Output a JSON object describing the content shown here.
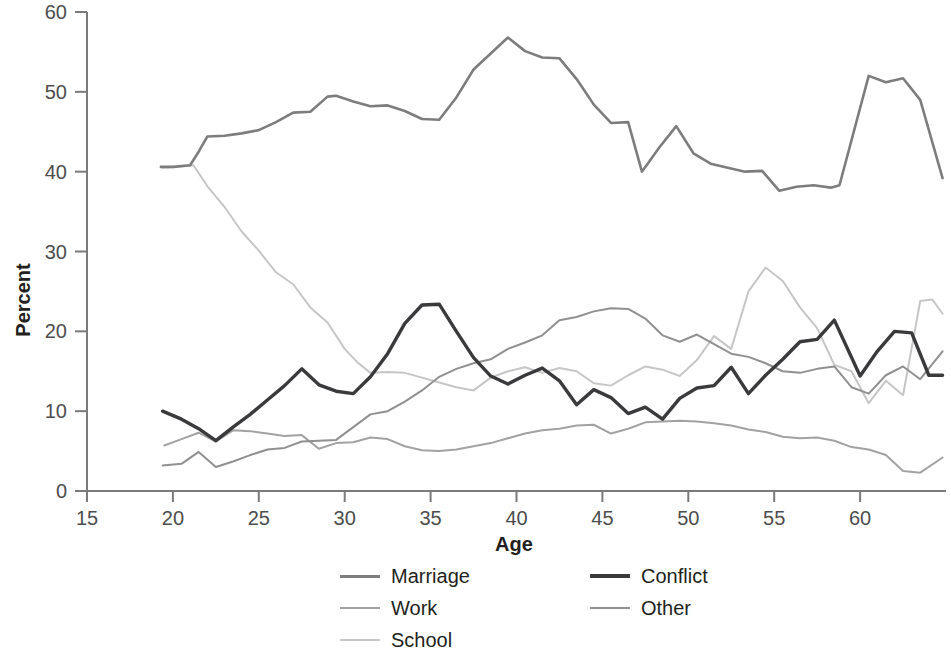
{
  "chart_data": {
    "type": "line",
    "title": "",
    "xlabel": "Age",
    "ylabel": "Percent",
    "xlim": [
      15,
      65
    ],
    "ylim": [
      0,
      60
    ],
    "xticks": [
      15,
      20,
      25,
      30,
      35,
      40,
      45,
      50,
      55,
      60
    ],
    "yticks": [
      0,
      10,
      20,
      30,
      40,
      50,
      60
    ],
    "grid": false,
    "legend_position": "bottom",
    "series": [
      {
        "name": "Marriage",
        "color": "#7d7d7d",
        "width": 2.6,
        "x": [
          19.3,
          20,
          21,
          21.5,
          22,
          23,
          24,
          25,
          26,
          27,
          28,
          29,
          29.5,
          30.5,
          31.5,
          32.5,
          33.5,
          34.5,
          35.5,
          36.5,
          37.5,
          38.5,
          39.5,
          40.5,
          41.5,
          42.5,
          43.5,
          44.5,
          45.5,
          46.5,
          47.3,
          48.3,
          49.3,
          50.3,
          51.3,
          52.3,
          53.3,
          54.3,
          55.3,
          56.3,
          57.3,
          58.3,
          58.8,
          60.5,
          61.5,
          62.5,
          63.5,
          64.8
        ],
        "values": [
          40.6,
          40.6,
          40.8,
          42.5,
          44.4,
          44.5,
          44.8,
          45.2,
          46.2,
          47.4,
          47.5,
          49.4,
          49.5,
          48.8,
          48.2,
          48.3,
          47.6,
          46.6,
          46.5,
          49.3,
          52.8,
          54.8,
          56.8,
          55.1,
          54.3,
          54.2,
          51.6,
          48.4,
          46.1,
          46.2,
          40.0,
          43.0,
          45.7,
          42.3,
          41.0,
          40.5,
          40.0,
          40.1,
          37.6,
          38.1,
          38.3,
          38.0,
          38.3,
          52.0,
          51.2,
          51.7,
          49.0,
          39.2
        ],
        "final_value": 39.2
      },
      {
        "name": "Conflict",
        "color": "#3a3a3c",
        "width": 3.4,
        "x": [
          19.4,
          20.5,
          21.5,
          22.5,
          23.5,
          24.5,
          25.5,
          26.5,
          27.5,
          28.5,
          29.5,
          30.5,
          31.5,
          32.5,
          33.5,
          34.5,
          35.5,
          36.5,
          37.5,
          38.5,
          39.5,
          40.5,
          41.5,
          42.5,
          43.5,
          44.5,
          45.5,
          46.5,
          47.5,
          48.5,
          49.5,
          50.5,
          51.5,
          52.5,
          53.5,
          54.5,
          55.5,
          56.5,
          57.5,
          58.5,
          60.0,
          61.0,
          62.0,
          63.0,
          64.0,
          64.8
        ],
        "values": [
          10.0,
          9.0,
          7.8,
          6.3,
          8.0,
          9.6,
          11.4,
          13.2,
          15.3,
          13.3,
          12.5,
          12.2,
          14.3,
          17.2,
          21.0,
          23.3,
          23.4,
          20.0,
          16.7,
          14.4,
          13.4,
          14.5,
          15.4,
          13.8,
          10.8,
          12.7,
          11.7,
          9.7,
          10.5,
          9.0,
          11.6,
          12.9,
          13.2,
          15.5,
          12.2,
          14.5,
          16.5,
          18.7,
          19.0,
          21.4,
          14.4,
          17.5,
          20.0,
          19.8,
          14.5,
          14.5
        ],
        "final_value": 14.5
      },
      {
        "name": "Work",
        "color": "#a2a2a2",
        "width": 2.0,
        "x": [
          19.5,
          20.5,
          21.5,
          22.5,
          23.5,
          24.5,
          25.5,
          26.5,
          27.5,
          28.5,
          29.5,
          30.5,
          31.5,
          32.5,
          33.5,
          34.5,
          35.5,
          36.5,
          37.5,
          38.5,
          39.5,
          40.5,
          41.5,
          42.5,
          43.5,
          44.5,
          45.5,
          46.5,
          47.5,
          48.5,
          49.5,
          50.5,
          51.5,
          52.5,
          53.5,
          54.5,
          55.5,
          56.5,
          57.5,
          58.5,
          59.5,
          60.5,
          61.5,
          62.5,
          63.5,
          64.8
        ],
        "values": [
          5.7,
          6.5,
          7.3,
          6.2,
          7.6,
          7.5,
          7.2,
          6.9,
          7.0,
          5.3,
          6.0,
          6.1,
          6.7,
          6.5,
          5.6,
          5.1,
          5.0,
          5.2,
          5.6,
          6.0,
          6.6,
          7.2,
          7.6,
          7.8,
          8.2,
          8.3,
          7.2,
          7.8,
          8.6,
          8.7,
          8.8,
          8.7,
          8.5,
          8.2,
          7.7,
          7.4,
          6.8,
          6.6,
          6.7,
          6.3,
          5.5,
          5.2,
          4.5,
          2.5,
          2.3,
          4.2
        ],
        "final_value": 4.2
      },
      {
        "name": "Other",
        "color": "#909090",
        "width": 2.0,
        "x": [
          19.4,
          20.5,
          21.5,
          22.5,
          23.5,
          24.5,
          25.5,
          26.5,
          27.5,
          28.5,
          29.5,
          30.5,
          31.5,
          32.5,
          33.5,
          34.5,
          35.5,
          36.5,
          37.5,
          38.5,
          39.5,
          40.5,
          41.5,
          42.5,
          43.5,
          44.5,
          45.5,
          46.5,
          47.5,
          48.5,
          49.5,
          50.5,
          51.5,
          52.5,
          53.5,
          54.5,
          55.5,
          56.5,
          57.5,
          58.5,
          59.5,
          60.5,
          61.5,
          62.5,
          63.5,
          64.8
        ],
        "values": [
          3.2,
          3.4,
          4.9,
          3.0,
          3.7,
          4.5,
          5.2,
          5.4,
          6.2,
          6.3,
          6.4,
          8.0,
          9.6,
          10.0,
          11.2,
          12.6,
          14.3,
          15.3,
          16.0,
          16.5,
          17.8,
          18.6,
          19.5,
          21.4,
          21.8,
          22.5,
          22.9,
          22.8,
          21.6,
          19.5,
          18.7,
          19.6,
          18.4,
          17.2,
          16.8,
          16.0,
          15.0,
          14.8,
          15.3,
          15.6,
          13.0,
          12.2,
          14.5,
          15.6,
          14.0,
          17.5
        ],
        "final_value": 17.5
      },
      {
        "name": "School",
        "color": "#c6c6c6",
        "width": 2.0,
        "x": [
          19.4,
          20.3,
          21.2,
          22.0,
          23.0,
          24.0,
          25.0,
          26.0,
          27.0,
          28.0,
          29.0,
          30.0,
          30.7,
          31.5,
          32.5,
          33.5,
          34.5,
          35.5,
          36.5,
          37.5,
          38.5,
          39.5,
          40.5,
          41.5,
          42.5,
          43.5,
          44.5,
          45.5,
          46.5,
          47.5,
          48.5,
          49.5,
          50.5,
          51.5,
          52.5,
          53.5,
          54.5,
          55.5,
          56.5,
          57.5,
          58.5,
          59.5,
          60.5,
          61.5,
          62.5,
          63.5,
          64.2,
          64.8
        ],
        "values": [
          40.5,
          40.6,
          40.8,
          38.2,
          35.6,
          32.5,
          30.1,
          27.4,
          25.9,
          23.0,
          21.1,
          17.8,
          16.2,
          14.8,
          14.9,
          14.8,
          14.2,
          13.6,
          13.0,
          12.6,
          14.2,
          15.0,
          15.5,
          14.8,
          15.4,
          15.0,
          13.5,
          13.2,
          14.5,
          15.6,
          15.2,
          14.4,
          16.4,
          19.4,
          17.8,
          25.0,
          28.0,
          26.3,
          23.0,
          20.4,
          15.8,
          15.0,
          11.0,
          13.8,
          12.0,
          23.8,
          24.0,
          22.2
        ],
        "final_value": 22.2
      }
    ]
  },
  "legend": {
    "entries": [
      {
        "label": "Marriage",
        "color": "#7d7d7d",
        "thickness": "3px"
      },
      {
        "label": "Conflict",
        "color": "#3a3a3c",
        "thickness": "4px"
      },
      {
        "label": "Work",
        "color": "#a2a2a2",
        "thickness": "2px"
      },
      {
        "label": "Other",
        "color": "#909090",
        "thickness": "2px"
      },
      {
        "label": "School",
        "color": "#c6c6c6",
        "thickness": "2px"
      }
    ]
  },
  "axes": {
    "y_label": "Percent",
    "x_label": "Age",
    "y_tick_labels": [
      "60",
      "50",
      "40",
      "30",
      "20",
      "10",
      "0"
    ],
    "x_tick_labels": [
      "15",
      "20",
      "25",
      "30",
      "35",
      "40",
      "45",
      "50",
      "55",
      "60"
    ],
    "axis_color": "#7a7a7a"
  }
}
